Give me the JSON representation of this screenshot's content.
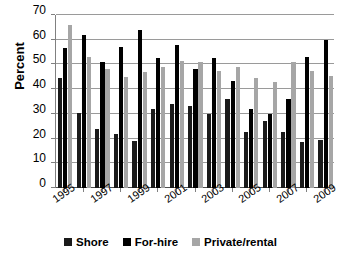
{
  "chart_data": {
    "type": "bar",
    "title": "",
    "xlabel": "",
    "ylabel": "Percent",
    "ylim": [
      0,
      70
    ],
    "ytick_step": 10,
    "yticks": [
      0,
      10,
      20,
      30,
      40,
      50,
      60,
      70
    ],
    "grid": true,
    "legend_position": "bottom-center",
    "categories": [
      "1995",
      "1996",
      "1997",
      "1998",
      "1999",
      "2000",
      "2001",
      "2002",
      "2003",
      "2004",
      "2005",
      "2006",
      "2007",
      "2008",
      "2009"
    ],
    "visible_tick_labels": [
      "1995",
      "1997",
      "1999",
      "2001",
      "2003",
      "2005",
      "2007",
      "2009"
    ],
    "series": [
      {
        "name": "Shore",
        "color": "#1a1a1a",
        "values": [
          44.5,
          30.5,
          24.0,
          22.0,
          19.0,
          32.0,
          34.0,
          33.0,
          30.0,
          36.0,
          22.5,
          27.0,
          22.5,
          18.5,
          19.5
        ]
      },
      {
        "name": "For-hire",
        "color": "#000000",
        "values": [
          56.5,
          62.0,
          51.0,
          57.0,
          64.0,
          52.5,
          58.0,
          48.0,
          52.5,
          43.5,
          32.0,
          30.0,
          36.0,
          53.0,
          60.0
        ]
      },
      {
        "name": "Private/rental",
        "color": "#a6a6a6",
        "values": [
          66.0,
          53.0,
          48.0,
          45.0,
          47.0,
          49.0,
          51.5,
          51.0,
          47.5,
          49.0,
          44.5,
          43.0,
          51.0,
          47.5,
          45.5
        ]
      }
    ]
  },
  "legend": {
    "items": [
      {
        "label": "Shore",
        "swatch": "shore"
      },
      {
        "label": "For-hire",
        "swatch": "forhire"
      },
      {
        "label": "Private/rental",
        "swatch": "private"
      }
    ]
  },
  "axes": {
    "y_title": "Percent"
  }
}
